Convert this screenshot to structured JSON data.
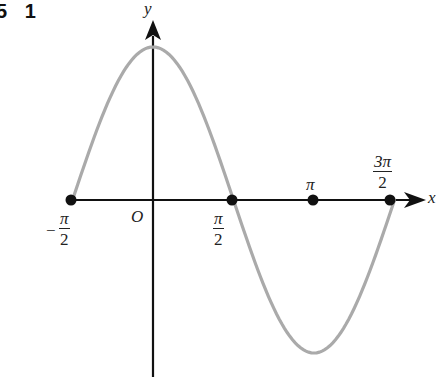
{
  "corner_label": "5 1",
  "chart_data": {
    "type": "line",
    "title": "",
    "function": "y = cos(x)",
    "xlabel": "x",
    "ylabel": "y",
    "origin_label": "O",
    "xlim": [
      -1.5708,
      4.7124
    ],
    "ylim": [
      -1,
      1
    ],
    "grid": false,
    "legend": null,
    "x_tick_labels": [
      "-π/2",
      "π/2",
      "π",
      "3π/2"
    ],
    "x": [
      -1.5708,
      -0.7854,
      0,
      0.7854,
      1.5708,
      2.3562,
      3.1416,
      3.927,
      4.7124
    ],
    "y": [
      0,
      0.707,
      1,
      0.707,
      0,
      -0.707,
      -1,
      -0.707,
      0
    ],
    "marked_points": [
      {
        "x": -1.5708,
        "y": 0,
        "label": "-π/2"
      },
      {
        "x": 1.5708,
        "y": 0,
        "label": "π/2"
      },
      {
        "x": 3.1416,
        "y": 0,
        "label": "π"
      },
      {
        "x": 4.7124,
        "y": 0,
        "label": "3π/2"
      }
    ],
    "curve_color": "#aaaaaa",
    "axis_color": "#111111",
    "point_color": "#111111"
  },
  "labels": {
    "y_axis": "y",
    "x_axis": "x",
    "origin": "O",
    "neg_sign": "−",
    "pi": "π",
    "three_pi": "3π",
    "two": "2"
  }
}
